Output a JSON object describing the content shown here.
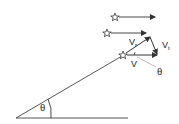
{
  "diagram": {
    "colors": {
      "line": "#333333",
      "leader": "#999999",
      "background": "#ffffff"
    },
    "labels": {
      "angle_main": "θ",
      "v_radial": "V",
      "v_radial_sub": "r",
      "v_tangential": "V",
      "v_tangential_sub": "t",
      "v_total": "V",
      "angle_triangle": "θ"
    },
    "stars": [
      {
        "name": "star-top",
        "x": 115,
        "y": 17,
        "arrow_to_x": 155
      },
      {
        "name": "star-middle",
        "x": 107,
        "y": 33,
        "arrow_to_x": 146
      },
      {
        "name": "star-line-of-sight",
        "x": 123,
        "y": 55,
        "arrow_to_x": 157
      }
    ]
  }
}
